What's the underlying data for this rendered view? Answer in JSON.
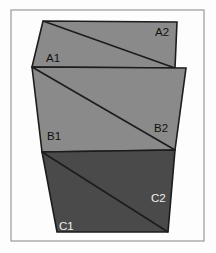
{
  "figure": {
    "title": "",
    "type": "geometric-diagram",
    "canvas": {
      "width": 216,
      "height": 253,
      "background": "#fdfdfd"
    },
    "frame": {
      "name": "outer-border",
      "x": 11,
      "y": 10,
      "width": 193,
      "height": 231,
      "stroke": "#9a9a9a",
      "stroke_width": 1.2,
      "fill": "none"
    },
    "panels": [
      {
        "id": "A",
        "name": "panel-a",
        "fill": "#8a8a8a",
        "stroke": "#1c1c1c",
        "stroke_width": 1.6,
        "points": "43,21 177,22 175,68 32,67",
        "diagonal": {
          "from": "43,21",
          "to": "175,68"
        },
        "labels": [
          {
            "id": "A1",
            "text": "A1",
            "x": 46,
            "y": 62,
            "color": "#111111"
          },
          {
            "id": "A2",
            "text": "A2",
            "x": 155,
            "y": 36,
            "color": "#111111"
          }
        ]
      },
      {
        "id": "B",
        "name": "panel-b",
        "fill": "#8a8a8a",
        "stroke": "#1c1c1c",
        "stroke_width": 1.6,
        "points": "32,67 186,68 175,150 42,152",
        "diagonal": {
          "from": "32,67",
          "to": "175,150"
        },
        "labels": [
          {
            "id": "B1",
            "text": "B1",
            "x": 47,
            "y": 140,
            "color": "#111111"
          },
          {
            "id": "B2",
            "text": "B2",
            "x": 154,
            "y": 132,
            "color": "#111111"
          }
        ]
      },
      {
        "id": "C",
        "name": "panel-c",
        "fill": "#4a4a4a",
        "stroke": "#1c1c1c",
        "stroke_width": 1.6,
        "points": "42,152 175,150 168,232 57,232",
        "diagonal": {
          "from": "42,152",
          "to": "168,232"
        },
        "labels": [
          {
            "id": "C1",
            "text": "C1",
            "x": 59,
            "y": 230,
            "color": "#efefef"
          },
          {
            "id": "C2",
            "text": "C2",
            "x": 151,
            "y": 202,
            "color": "#efefef"
          }
        ]
      }
    ]
  }
}
